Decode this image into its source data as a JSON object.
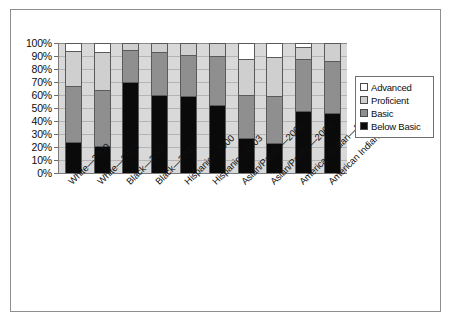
{
  "chart_data": {
    "type": "bar",
    "subtype": "stacked-percentage",
    "title": "",
    "xlabel": "",
    "ylabel": "",
    "ylim": [
      0,
      100
    ],
    "ytick_labels": [
      "0%",
      "10%",
      "20%",
      "30%",
      "40%",
      "50%",
      "60%",
      "70%",
      "80%",
      "90%",
      "100%"
    ],
    "ytick_values": [
      0,
      10,
      20,
      30,
      40,
      50,
      60,
      70,
      80,
      90,
      100
    ],
    "grid": true,
    "legend_position": "right",
    "categories": [
      "White—2000",
      "White—2003",
      "Black—2000",
      "Black—2003",
      "Hispanic—2000",
      "Hispanic—2003",
      "Asian/Pacific—2000",
      "Asian/Pacific—2003",
      "American Indian—2000",
      "American Indian—2003"
    ],
    "series": [
      {
        "name": "Below Basic",
        "color": "#0a0a0a",
        "values": [
          24,
          21,
          70,
          60,
          59,
          52,
          27,
          23,
          48,
          46
        ]
      },
      {
        "name": "Basic",
        "color": "#8f8f8f",
        "values": [
          43,
          43,
          25,
          33,
          32,
          38,
          33,
          36,
          40,
          40
        ]
      },
      {
        "name": "Proficient",
        "color": "#cfcfcf",
        "values": [
          27,
          29,
          5,
          7,
          9,
          10,
          28,
          30,
          9,
          14
        ]
      },
      {
        "name": "Advanced",
        "color": "#ffffff",
        "values": [
          6,
          7,
          0,
          0,
          0,
          0,
          12,
          11,
          3,
          0
        ]
      }
    ],
    "cumulative_tops": {
      "below_basic": [
        24,
        21,
        70,
        60,
        59,
        52,
        27,
        23,
        48,
        46
      ],
      "basic": [
        67,
        64,
        95,
        93,
        91,
        90,
        60,
        59,
        88,
        86
      ],
      "proficient": [
        94,
        93,
        100,
        100,
        100,
        100,
        88,
        89,
        97,
        100
      ],
      "advanced": [
        100,
        100,
        100,
        100,
        100,
        100,
        100,
        100,
        100,
        100
      ]
    }
  },
  "legend": {
    "items": [
      {
        "label": "Advanced",
        "color": "#ffffff"
      },
      {
        "label": "Proficient",
        "color": "#cfcfcf"
      },
      {
        "label": "Basic",
        "color": "#8f8f8f"
      },
      {
        "label": "Below Basic",
        "color": "#0a0a0a"
      }
    ]
  },
  "colors": {
    "plot_background": "#d9d9d9",
    "gridline": "#b4b4b4",
    "axis": "#7a7a7a",
    "figure_border": "#8e8e8e",
    "text": "#0d0d0d"
  }
}
